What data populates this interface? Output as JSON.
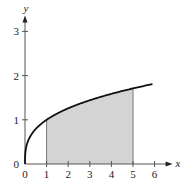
{
  "chart_data": {
    "type": "area",
    "title": "",
    "function": "y = x^(1/3)",
    "xlabel": "x",
    "ylabel": "y",
    "xlim": [
      0,
      6
    ],
    "ylim": [
      0,
      3
    ],
    "x_ticks": [
      0,
      1,
      2,
      3,
      4,
      5,
      6
    ],
    "x_tick_labels": [
      "0",
      "1",
      "2",
      "3",
      "4",
      "5",
      "6"
    ],
    "y_ticks": [
      0,
      1,
      2,
      3
    ],
    "y_tick_labels": [
      "0",
      "1",
      "2",
      "3"
    ],
    "curve_domain": [
      0,
      5.9
    ],
    "shaded_interval": [
      1,
      5
    ],
    "grid": false,
    "legend": "none",
    "colors": {
      "curve": "#111111",
      "axes": "#555555",
      "shade": "#d4d4d4",
      "shade_edge": "#777777"
    }
  }
}
